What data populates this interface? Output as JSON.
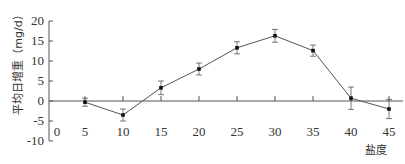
{
  "chart_data": {
    "type": "line",
    "title": "",
    "xlabel": "盐度",
    "ylabel": "平均日增重（mg/d）",
    "x": [
      5,
      10,
      15,
      20,
      25,
      30,
      35,
      40,
      45
    ],
    "series": [
      {
        "name": "平均日增重",
        "values": [
          -0.3,
          -3.5,
          3.3,
          8.0,
          13.3,
          16.3,
          12.6,
          0.7,
          -2.0
        ],
        "error": [
          1.0,
          1.5,
          1.7,
          1.5,
          1.5,
          1.6,
          1.4,
          2.8,
          2.4
        ]
      }
    ],
    "xticks": [
      "0",
      "5",
      "10",
      "15",
      "20",
      "25",
      "30",
      "35",
      "40",
      "45"
    ],
    "yticks": [
      "-10",
      "-5",
      "0",
      "5",
      "10",
      "15",
      "20"
    ],
    "xlim": [
      0,
      45
    ],
    "ylim": [
      -10,
      20
    ],
    "grid": false,
    "legend": "none",
    "x_axis_at_y": 0
  },
  "colors": {
    "line": "#555555",
    "marker": "#111111",
    "axis": "#555555",
    "text": "#333333"
  }
}
